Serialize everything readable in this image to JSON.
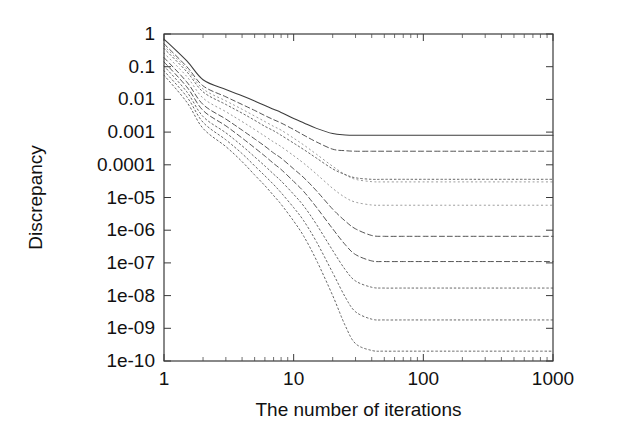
{
  "figure": {
    "background": "#ffffff",
    "ink_color": "#2b2b2b",
    "frame_color": "#3a3a3a",
    "title": "",
    "width": 617,
    "height": 447
  },
  "axes": {
    "x": {
      "label": "The number of iterations",
      "scale": "log",
      "range": [
        1,
        1000
      ],
      "ticks": [
        {
          "value": 1,
          "label": "1"
        },
        {
          "value": 10,
          "label": "10"
        },
        {
          "value": 100,
          "label": "100"
        },
        {
          "value": 1000,
          "label": "1000"
        }
      ]
    },
    "y": {
      "label": "Discrepancy",
      "scale": "log",
      "range": [
        1e-10,
        1
      ],
      "ticks": [
        {
          "value": 1,
          "label": "1"
        },
        {
          "value": 0.1,
          "label": "0.1"
        },
        {
          "value": 0.01,
          "label": "0.01"
        },
        {
          "value": 0.001,
          "label": "0.001"
        },
        {
          "value": 0.0001,
          "label": "0.0001"
        },
        {
          "value": 1e-05,
          "label": "1e-05"
        },
        {
          "value": 1e-06,
          "label": "1e-06"
        },
        {
          "value": 1e-07,
          "label": "1e-07"
        },
        {
          "value": 1e-08,
          "label": "1e-08"
        },
        {
          "value": 1e-09,
          "label": "1e-09"
        },
        {
          "value": 1e-10,
          "label": "1e-10"
        }
      ]
    },
    "grid": false,
    "legend": "none",
    "frame": "box"
  },
  "plot_geometry": {
    "left": 164,
    "right": 553,
    "top": 34,
    "bottom": 361
  },
  "chart_data": {
    "type": "line",
    "title": "",
    "xlabel": "The number of iterations",
    "ylabel": "Discrepancy",
    "xscale": "log",
    "yscale": "log",
    "xlim": [
      1,
      1000
    ],
    "ylim": [
      1e-10,
      1
    ],
    "xticks": [
      1,
      10,
      100,
      1000
    ],
    "xticklabels": [
      "1",
      "10",
      "100",
      "1000"
    ],
    "yticks": [
      1,
      0.1,
      0.01,
      0.001,
      0.0001,
      1e-05,
      1e-06,
      1e-07,
      1e-08,
      1e-09,
      1e-10
    ],
    "yticklabels": [
      "1",
      "0.1",
      "0.01",
      "0.001",
      "0.0001",
      "1e-05",
      "1e-06",
      "1e-07",
      "1e-08",
      "1e-09",
      "1e-10"
    ],
    "grid": false,
    "legend": {
      "visible": false,
      "position": "none"
    },
    "annotations": [],
    "x": [
      1,
      1.5,
      2,
      3,
      4,
      5,
      6,
      7,
      8,
      10,
      12,
      15,
      20,
      25,
      30,
      40,
      50,
      70,
      100,
      150,
      200,
      300,
      500,
      700,
      1000
    ],
    "series": [
      {
        "name": "curve-1",
        "style": "solid",
        "floor": 0.0008,
        "values": [
          0.7,
          0.15,
          0.04,
          0.02,
          0.013,
          0.009,
          0.0065,
          0.005,
          0.004,
          0.0026,
          0.0019,
          0.0013,
          0.0009,
          0.00082,
          0.0008,
          0.0008,
          0.0008,
          0.0008,
          0.0008,
          0.0008,
          0.0008,
          0.0008,
          0.0008,
          0.0008,
          0.0008
        ]
      },
      {
        "name": "curve-2",
        "style": "dashed",
        "floor": 0.00026,
        "values": [
          0.5,
          0.1,
          0.026,
          0.012,
          0.007,
          0.0046,
          0.0032,
          0.0024,
          0.0019,
          0.0012,
          0.0008,
          0.0005,
          0.0003,
          0.00027,
          0.00026,
          0.00026,
          0.00026,
          0.00026,
          0.00026,
          0.00026,
          0.00026,
          0.00026,
          0.00026,
          0.00026,
          0.00026
        ]
      },
      {
        "name": "curve-3",
        "style": "dotted",
        "floor": 3.6e-05,
        "values": [
          0.36,
          0.07,
          0.017,
          0.007,
          0.0038,
          0.0023,
          0.0015,
          0.0011,
          0.0008,
          0.00046,
          0.00029,
          0.00016,
          7.5e-05,
          5e-05,
          4e-05,
          3.6e-05,
          3.6e-05,
          3.6e-05,
          3.6e-05,
          3.6e-05,
          3.6e-05,
          3.6e-05,
          3.6e-05,
          3.6e-05,
          3.6e-05
        ]
      },
      {
        "name": "curve-4",
        "style": "dotted-light",
        "floor": 5.8e-06,
        "values": [
          0.26,
          0.05,
          0.011,
          0.0042,
          0.0021,
          0.0012,
          0.00075,
          0.0005,
          0.00036,
          0.00019,
          0.00011,
          5.2e-05,
          1.9e-05,
          1e-05,
          7.2e-06,
          5.9e-06,
          5.8e-06,
          5.8e-06,
          5.8e-06,
          5.8e-06,
          5.8e-06,
          5.8e-06,
          5.8e-06,
          5.8e-06,
          5.8e-06
        ]
      },
      {
        "name": "curve-5",
        "style": "dashed",
        "floor": 6.5e-07,
        "values": [
          0.19,
          0.034,
          0.007,
          0.0025,
          0.00115,
          0.00062,
          0.00037,
          0.00023,
          0.00016,
          7.5e-05,
          4e-05,
          1.6e-05,
          4.4e-06,
          1.9e-06,
          1.1e-06,
          6.9e-07,
          6.5e-07,
          6.5e-07,
          6.5e-07,
          6.5e-07,
          6.5e-07,
          6.5e-07,
          6.5e-07,
          6.5e-07,
          6.5e-07
        ]
      },
      {
        "name": "curve-6",
        "style": "dashed",
        "floor": 1.1e-07,
        "values": [
          0.14,
          0.024,
          0.0046,
          0.00155,
          0.00066,
          0.00033,
          0.000185,
          0.00011,
          7.2e-05,
          3.1e-05,
          1.5e-05,
          5e-06,
          1.1e-06,
          3.6e-07,
          1.8e-07,
          1.15e-07,
          1.1e-07,
          1.1e-07,
          1.1e-07,
          1.1e-07,
          1.1e-07,
          1.1e-07,
          1.1e-07,
          1.1e-07,
          1.1e-07
        ]
      },
      {
        "name": "curve-7",
        "style": "dotted",
        "floor": 1.7e-08,
        "values": [
          0.105,
          0.017,
          0.003,
          0.00095,
          0.00038,
          0.000175,
          9.2e-05,
          5.2e-05,
          3.2e-05,
          1.25e-05,
          5.4e-06,
          1.5e-06,
          2.4e-07,
          6.2e-08,
          2.8e-08,
          1.8e-08,
          1.7e-08,
          1.7e-08,
          1.7e-08,
          1.7e-08,
          1.7e-08,
          1.7e-08,
          1.7e-08,
          1.7e-08,
          1.7e-08
        ]
      },
      {
        "name": "curve-8",
        "style": "dotted",
        "floor": 1.8e-09,
        "values": [
          0.075,
          0.012,
          0.002,
          0.00058,
          0.00022,
          9.3e-05,
          4.6e-05,
          2.5e-05,
          1.4e-05,
          4.9e-06,
          1.9e-06,
          4.4e-07,
          5e-08,
          9e-09,
          3.2e-09,
          1.9e-09,
          1.8e-09,
          1.8e-09,
          1.8e-09,
          1.8e-09,
          1.8e-09,
          1.8e-09,
          1.8e-09,
          1.8e-09,
          1.8e-09
        ]
      },
      {
        "name": "curve-9",
        "style": "dotted",
        "floor": 2e-10,
        "values": [
          0.055,
          0.0082,
          0.0013,
          0.00036,
          0.000125,
          4.9e-05,
          2.3e-05,
          1.15e-05,
          6.2e-06,
          1.9e-06,
          6.4e-07,
          1.2e-07,
          1e-08,
          1.2e-09,
          3.4e-10,
          2.1e-10,
          2e-10,
          2e-10,
          2e-10,
          2e-10,
          2e-10,
          2e-10,
          2e-10,
          2e-10,
          2e-10
        ]
      },
      {
        "name": "curve-10",
        "style": "dotted-light",
        "floor": 3e-05,
        "values": [
          0.43,
          0.085,
          0.021,
          0.009,
          0.005,
          0.0031,
          0.0021,
          0.0015,
          0.00115,
          0.00065,
          0.0004,
          0.00021,
          9e-05,
          5e-05,
          3.6e-05,
          3.05e-05,
          3e-05,
          3e-05,
          3e-05,
          3e-05,
          3e-05,
          3e-05,
          3e-05,
          3e-05,
          3e-05
        ]
      }
    ]
  }
}
